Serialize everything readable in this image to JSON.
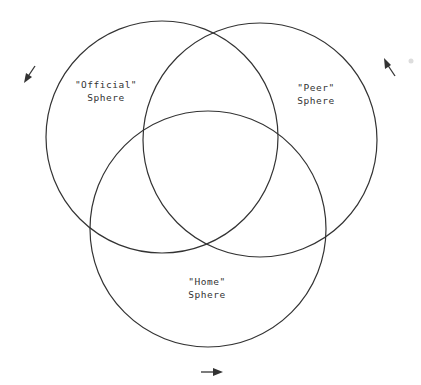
{
  "diagram": {
    "type": "venn",
    "stroke_color": "#333333",
    "circles": [
      {
        "id": "official",
        "label_line1": "\"Official\"",
        "label_line2": "Sphere",
        "cx": 162,
        "cy": 137,
        "r": 116
      },
      {
        "id": "peer",
        "label_line1": "\"Peer\"",
        "label_line2": "Sphere",
        "cx": 260,
        "cy": 140,
        "r": 117
      },
      {
        "id": "home",
        "label_line1": "\"Home\"",
        "label_line2": "Sphere",
        "cx": 208,
        "cy": 229,
        "r": 118
      }
    ],
    "arrows": [
      {
        "id": "arrow-official",
        "direction": "down-left"
      },
      {
        "id": "arrow-peer",
        "direction": "up-left"
      },
      {
        "id": "arrow-home",
        "direction": "right"
      }
    ]
  }
}
